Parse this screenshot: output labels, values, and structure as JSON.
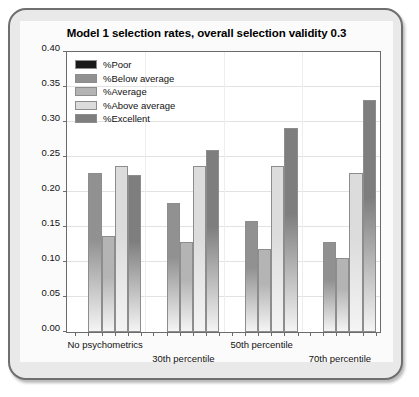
{
  "chart_data": {
    "type": "bar",
    "title": "Model 1 selection rates, overall selection validity 0.3",
    "xlabel": "",
    "ylabel": "",
    "ylim": [
      0.0,
      0.4
    ],
    "ytick_labels": [
      "0.00",
      "0.05",
      "0.10",
      "0.15",
      "0.20",
      "0.25",
      "0.30",
      "0.35",
      "0.40"
    ],
    "ytick_values": [
      0.0,
      0.05,
      0.1,
      0.15,
      0.2,
      0.25,
      0.3,
      0.35,
      0.4
    ],
    "grid": true,
    "legend_position": "top-left",
    "categories": [
      "No psychometrics",
      "30th percentile",
      "50th percentile",
      "70th percentile"
    ],
    "series": [
      {
        "name": "%Poor",
        "color": "#1a1a1a",
        "values": [
          0.0,
          0.0,
          0.0,
          0.0
        ]
      },
      {
        "name": "%Below average",
        "color": "#919191",
        "values": [
          0.227,
          0.184,
          0.159,
          0.128
        ]
      },
      {
        "name": "%Average",
        "color": "#b4b4b4",
        "values": [
          0.137,
          0.128,
          0.118,
          0.106
        ]
      },
      {
        "name": "%Above average",
        "color": "#dcdcdc",
        "values": [
          0.237,
          0.237,
          0.237,
          0.227
        ]
      },
      {
        "name": "%Excellent",
        "color": "#7e7e7e",
        "values": [
          0.225,
          0.26,
          0.291,
          0.331
        ]
      }
    ]
  },
  "legend": {
    "items": [
      {
        "label": "%Poor"
      },
      {
        "label": "%Below average"
      },
      {
        "label": "%Average"
      },
      {
        "label": "%Above average"
      },
      {
        "label": "%Excellent"
      }
    ]
  },
  "colors": {
    "frame_border": "#6f6f6f",
    "frame_fill": "#e9e9e9",
    "panel_fill": "#fbfbfb",
    "plot_fill": "#ffffff",
    "axis": "#6b6b6b",
    "grid": "#e2e2e2"
  }
}
